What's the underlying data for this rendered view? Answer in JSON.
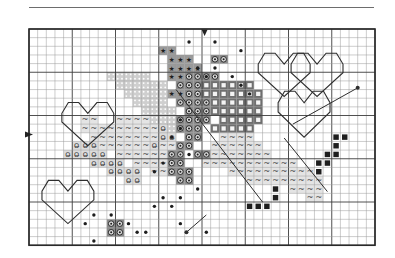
{
  "page": {
    "type": "cross-stitch pattern chart",
    "rule_color": "#6d6d6d"
  },
  "grid": {
    "origin_x": 29,
    "origin_y": 29,
    "cell": 8.65,
    "cols": 40,
    "rows": 25,
    "major_every": 5,
    "minor_color": "#9a9a9a",
    "major_color": "#3c3c3c",
    "border_color": "#2a2a2a"
  },
  "center_markers": {
    "top_col": 20.3,
    "left_row": 12.2,
    "color": "#222222"
  },
  "symbols": {
    "star": {
      "glyph": "★",
      "fill": "#9a9a9a",
      "color": "#1e1e1e"
    },
    "circle": {
      "glyph": "◎",
      "fill": "#8a8a8a",
      "color": "#1e1e1e"
    },
    "square": {
      "glyph": "■",
      "fill": "#6f6f6f",
      "color": "#f2f2f2"
    },
    "brick": {
      "glyph": "▦",
      "fill": "#cfcfcf",
      "color": "#6a6a6a"
    },
    "wave": {
      "glyph": "~",
      "fill": "#e4e4e4",
      "color": "#444444"
    },
    "oh": {
      "glyph": "O̶",
      "fill": "#dcdcdc",
      "color": "#333333"
    },
    "dark": {
      "glyph": "■",
      "fill": "#ffffff",
      "color": "#1e1e1e"
    },
    "dot": {
      "glyph": "",
      "fill": "none",
      "color": "#1e1e1e"
    }
  },
  "cells": {
    "star": [
      [
        15,
        2
      ],
      [
        16,
        2
      ],
      [
        16,
        3
      ],
      [
        17,
        3
      ],
      [
        18,
        3
      ],
      [
        16,
        4
      ],
      [
        17,
        4
      ],
      [
        18,
        4
      ],
      [
        19,
        4
      ],
      [
        16,
        5
      ],
      [
        17,
        5
      ],
      [
        16,
        7
      ],
      [
        17,
        7
      ]
    ],
    "brick": [
      [
        9,
        5
      ],
      [
        10,
        5
      ],
      [
        11,
        5
      ],
      [
        12,
        5
      ],
      [
        13,
        5
      ],
      [
        10,
        6
      ],
      [
        11,
        6
      ],
      [
        12,
        6
      ],
      [
        13,
        6
      ],
      [
        14,
        6
      ],
      [
        15,
        6
      ],
      [
        11,
        7
      ],
      [
        12,
        7
      ],
      [
        13,
        7
      ],
      [
        14,
        7
      ],
      [
        15,
        7
      ],
      [
        12,
        8
      ],
      [
        13,
        8
      ],
      [
        14,
        8
      ],
      [
        15,
        8
      ],
      [
        13,
        9
      ],
      [
        14,
        9
      ],
      [
        15,
        9
      ],
      [
        16,
        9
      ],
      [
        14,
        10
      ],
      [
        15,
        10
      ],
      [
        16,
        10
      ],
      [
        15,
        11
      ],
      [
        16,
        11
      ]
    ],
    "circle": [
      [
        18,
        5
      ],
      [
        19,
        5
      ],
      [
        17,
        6
      ],
      [
        18,
        6
      ],
      [
        19,
        6
      ],
      [
        18,
        7
      ],
      [
        19,
        7
      ],
      [
        17,
        8
      ],
      [
        18,
        8
      ],
      [
        19,
        8
      ],
      [
        18,
        9
      ],
      [
        19,
        9
      ],
      [
        17,
        10
      ],
      [
        18,
        10
      ],
      [
        19,
        10
      ],
      [
        17,
        11
      ],
      [
        18,
        11
      ],
      [
        19,
        11
      ],
      [
        18,
        12
      ],
      [
        19,
        12
      ],
      [
        20,
        8
      ],
      [
        20,
        9
      ],
      [
        20,
        10
      ],
      [
        17,
        13
      ],
      [
        18,
        13
      ],
      [
        19,
        14
      ],
      [
        20,
        14
      ],
      [
        16,
        14
      ],
      [
        17,
        14
      ],
      [
        16,
        15
      ],
      [
        17,
        15
      ],
      [
        16,
        16
      ],
      [
        17,
        16
      ],
      [
        18,
        16
      ],
      [
        17,
        17
      ],
      [
        18,
        17
      ],
      [
        21,
        3
      ],
      [
        22,
        3
      ],
      [
        20,
        5
      ],
      [
        21,
        5
      ],
      [
        9,
        22
      ],
      [
        10,
        22
      ],
      [
        9,
        23
      ],
      [
        10,
        23
      ]
    ],
    "square": [
      [
        20,
        6
      ],
      [
        21,
        6
      ],
      [
        22,
        6
      ],
      [
        23,
        6
      ],
      [
        24,
        6
      ],
      [
        25,
        6
      ],
      [
        20,
        7
      ],
      [
        21,
        7
      ],
      [
        22,
        7
      ],
      [
        23,
        7
      ],
      [
        24,
        7
      ],
      [
        25,
        7
      ],
      [
        26,
        7
      ],
      [
        21,
        8
      ],
      [
        22,
        8
      ],
      [
        23,
        8
      ],
      [
        24,
        8
      ],
      [
        25,
        8
      ],
      [
        26,
        8
      ],
      [
        21,
        9
      ],
      [
        22,
        9
      ],
      [
        23,
        9
      ],
      [
        24,
        9
      ],
      [
        25,
        9
      ],
      [
        26,
        9
      ],
      [
        22,
        10
      ],
      [
        23,
        10
      ],
      [
        24,
        10
      ],
      [
        25,
        10
      ],
      [
        26,
        10
      ],
      [
        21,
        11
      ],
      [
        22,
        11
      ],
      [
        23,
        11
      ],
      [
        24,
        11
      ],
      [
        25,
        11
      ]
    ],
    "wave": [
      [
        10,
        10
      ],
      [
        11,
        10
      ],
      [
        12,
        10
      ],
      [
        13,
        10
      ],
      [
        9,
        11
      ],
      [
        10,
        11
      ],
      [
        11,
        11
      ],
      [
        12,
        11
      ],
      [
        13,
        11
      ],
      [
        14,
        11
      ],
      [
        9,
        12
      ],
      [
        10,
        12
      ],
      [
        11,
        12
      ],
      [
        12,
        12
      ],
      [
        13,
        12
      ],
      [
        14,
        12
      ],
      [
        15,
        12
      ],
      [
        8,
        13
      ],
      [
        9,
        13
      ],
      [
        10,
        13
      ],
      [
        11,
        13
      ],
      [
        12,
        13
      ],
      [
        13,
        13
      ],
      [
        14,
        13
      ],
      [
        15,
        13
      ],
      [
        16,
        13
      ],
      [
        10,
        14
      ],
      [
        11,
        14
      ],
      [
        12,
        14
      ],
      [
        13,
        14
      ],
      [
        14,
        14
      ],
      [
        15,
        14
      ],
      [
        12,
        15
      ],
      [
        13,
        15
      ],
      [
        14,
        15
      ],
      [
        15,
        15
      ],
      [
        14,
        16
      ],
      [
        15,
        16
      ],
      [
        22,
        12
      ],
      [
        23,
        12
      ],
      [
        24,
        12
      ],
      [
        25,
        12
      ],
      [
        21,
        13
      ],
      [
        22,
        13
      ],
      [
        23,
        13
      ],
      [
        24,
        13
      ],
      [
        25,
        13
      ],
      [
        26,
        13
      ],
      [
        21,
        14
      ],
      [
        22,
        14
      ],
      [
        23,
        14
      ],
      [
        24,
        14
      ],
      [
        25,
        14
      ],
      [
        26,
        14
      ],
      [
        27,
        14
      ],
      [
        20,
        15
      ],
      [
        21,
        15
      ],
      [
        22,
        15
      ],
      [
        23,
        15
      ],
      [
        24,
        15
      ],
      [
        25,
        15
      ],
      [
        26,
        15
      ],
      [
        27,
        15
      ],
      [
        28,
        15
      ],
      [
        29,
        15
      ],
      [
        30,
        15
      ],
      [
        23,
        16
      ],
      [
        24,
        16
      ],
      [
        25,
        16
      ],
      [
        26,
        16
      ],
      [
        27,
        16
      ],
      [
        28,
        16
      ],
      [
        29,
        16
      ],
      [
        30,
        16
      ],
      [
        31,
        16
      ],
      [
        32,
        16
      ],
      [
        25,
        17
      ],
      [
        26,
        17
      ],
      [
        27,
        17
      ],
      [
        28,
        17
      ],
      [
        29,
        17
      ],
      [
        30,
        17
      ],
      [
        31,
        17
      ],
      [
        32,
        17
      ],
      [
        33,
        17
      ],
      [
        30,
        18
      ],
      [
        31,
        18
      ],
      [
        32,
        18
      ],
      [
        33,
        18
      ],
      [
        32,
        19
      ],
      [
        33,
        19
      ],
      [
        6,
        10
      ],
      [
        7,
        10
      ],
      [
        6,
        11
      ],
      [
        7,
        11
      ],
      [
        8,
        11
      ],
      [
        7,
        12
      ],
      [
        8,
        12
      ]
    ],
    "oh": [
      [
        5,
        13
      ],
      [
        6,
        13
      ],
      [
        7,
        13
      ],
      [
        4,
        14
      ],
      [
        5,
        14
      ],
      [
        6,
        14
      ],
      [
        7,
        14
      ],
      [
        8,
        14
      ],
      [
        7,
        15
      ],
      [
        8,
        15
      ],
      [
        9,
        15
      ],
      [
        10,
        15
      ],
      [
        9,
        16
      ],
      [
        10,
        16
      ],
      [
        11,
        16
      ],
      [
        12,
        16
      ],
      [
        11,
        17
      ],
      [
        12,
        17
      ],
      [
        14,
        13
      ],
      [
        15,
        12
      ],
      [
        16,
        12
      ],
      [
        15,
        11
      ]
    ],
    "dark": [
      [
        35,
        12
      ],
      [
        36,
        12
      ],
      [
        35,
        13
      ],
      [
        34,
        14
      ],
      [
        35,
        14
      ],
      [
        33,
        15
      ],
      [
        34,
        15
      ],
      [
        33,
        16
      ],
      [
        25,
        20
      ],
      [
        26,
        20
      ],
      [
        27,
        20
      ],
      [
        28,
        18
      ],
      [
        28,
        19
      ]
    ],
    "dot": [
      [
        18,
        1
      ],
      [
        21,
        1
      ],
      [
        24,
        2
      ],
      [
        19,
        4
      ],
      [
        21,
        4
      ],
      [
        20,
        5
      ],
      [
        23,
        5
      ],
      [
        24,
        6
      ],
      [
        25,
        7
      ],
      [
        17,
        10
      ],
      [
        17,
        11
      ],
      [
        16,
        12
      ],
      [
        18,
        14
      ],
      [
        15,
        15
      ],
      [
        14,
        16
      ],
      [
        19,
        18
      ],
      [
        17,
        19
      ],
      [
        15,
        19
      ],
      [
        16,
        20
      ],
      [
        14,
        20
      ],
      [
        9,
        21
      ],
      [
        7,
        21
      ],
      [
        11,
        22
      ],
      [
        13,
        23
      ],
      [
        12,
        23
      ],
      [
        7,
        24
      ],
      [
        6,
        22
      ],
      [
        17,
        22
      ],
      [
        20,
        23
      ]
    ]
  },
  "outlines": {
    "color": "#2e2e2e",
    "hearts": [
      {
        "name": "heart-top-right-1",
        "cx": 29.5,
        "cy": 2.8,
        "w": 6,
        "h": 5
      },
      {
        "name": "heart-top-right-2",
        "cx": 33.3,
        "cy": 2.8,
        "w": 6,
        "h": 5
      },
      {
        "name": "heart-right-lower",
        "cx": 31.8,
        "cy": 7.2,
        "w": 6,
        "h": 5.3
      },
      {
        "name": "heart-left-mid",
        "cx": 6.8,
        "cy": 8.5,
        "w": 6,
        "h": 5
      },
      {
        "name": "heart-bottom-left",
        "cx": 4.5,
        "cy": 17.5,
        "w": 6,
        "h": 5
      }
    ],
    "lines": [
      [
        [
          30.5,
          11
        ],
        [
          38,
          6.8
        ]
      ],
      [
        [
          29.5,
          12.6
        ],
        [
          34.5,
          18.8
        ]
      ],
      [
        [
          18.2,
          23.5
        ],
        [
          20.5,
          21.5
        ]
      ],
      [
        [
          17,
          7
        ],
        [
          27,
          20
        ]
      ]
    ],
    "line_dots": [
      [
        38,
        6.8
      ],
      [
        18.2,
        23.5
      ]
    ]
  }
}
